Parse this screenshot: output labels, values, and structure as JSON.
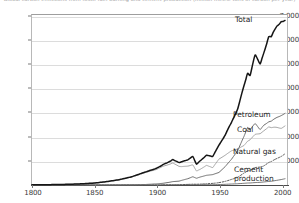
{
  "chart_title": "Global carbon emissions from fossil-fuel burning and cement production (million metric tons of carbon per year)",
  "axis": {
    "y_ticks": [
      "1,000",
      "2,000",
      "3,000",
      "4,000",
      "5,000",
      "6,000",
      "7,000"
    ],
    "x_ticks": [
      "1800",
      "1850",
      "1900",
      "1950",
      "2000"
    ]
  },
  "labels": {
    "total": "Total",
    "petroleum": "Petroleum",
    "coal": "Coal",
    "natural_gas": "Natural gas",
    "cement_line1": "Cement",
    "cement_line2": "production"
  },
  "colors": {
    "total": "#161616",
    "petroleum": "#6e6e6e",
    "coal": "#a0a0a0",
    "natural_gas": "#5a5a5a",
    "cement": "#555555",
    "grid": "#dcdcdc",
    "frame": "#b8b8b8",
    "text": "#1d1d1d"
  },
  "chart_data": {
    "type": "line",
    "title": "Global carbon emissions from fossil-fuel burning and cement production (million metric tons of carbon per year)",
    "xlabel": "",
    "ylabel": "",
    "xlim": [
      1800,
      2005
    ],
    "ylim": [
      0,
      7400
    ],
    "grid": true,
    "legend": "inline-right-of-line-ends",
    "x": [
      1800,
      1810,
      1820,
      1830,
      1840,
      1850,
      1860,
      1870,
      1880,
      1890,
      1900,
      1905,
      1910,
      1913,
      1918,
      1920,
      1925,
      1929,
      1932,
      1935,
      1940,
      1945,
      1950,
      1955,
      1960,
      1965,
      1970,
      1973,
      1975,
      1979,
      1983,
      1986,
      1990,
      1992,
      1995,
      2000,
      2003
    ],
    "series": [
      {
        "name": "Total",
        "style": "solid-thick",
        "color": "#161616",
        "values": [
          8,
          12,
          18,
          30,
          50,
          80,
          140,
          220,
          340,
          520,
          690,
          840,
          960,
          1050,
          930,
          960,
          1040,
          1180,
          860,
          1000,
          1230,
          1180,
          1650,
          2060,
          2580,
          3140,
          4090,
          4620,
          4530,
          5370,
          5000,
          5460,
          6130,
          6130,
          6440,
          6750,
          6800
        ]
      },
      {
        "name": "Petroleum",
        "style": "solid",
        "color": "#6e6e6e",
        "values": [
          0,
          0,
          0,
          0,
          0,
          0,
          1,
          3,
          8,
          18,
          46,
          70,
          110,
          140,
          160,
          190,
          260,
          340,
          280,
          330,
          400,
          430,
          520,
          760,
          1060,
          1420,
          2000,
          2380,
          2290,
          2540,
          2290,
          2470,
          2610,
          2640,
          2750,
          2870,
          2960
        ]
      },
      {
        "name": "Coal",
        "style": "solid",
        "color": "#a0a0a0",
        "values": [
          8,
          12,
          18,
          30,
          50,
          80,
          139,
          217,
          332,
          502,
          644,
          770,
          850,
          910,
          770,
          760,
          780,
          830,
          580,
          650,
          810,
          720,
          1070,
          1230,
          1410,
          1490,
          1630,
          1810,
          1870,
          2090,
          2120,
          2240,
          2400,
          2370,
          2390,
          2340,
          2440
        ]
      },
      {
        "name": "Natural gas",
        "style": "dotted",
        "color": "#5a5a5a",
        "values": [
          0,
          0,
          0,
          0,
          0,
          0,
          0,
          0,
          0,
          0,
          3,
          5,
          8,
          10,
          13,
          16,
          25,
          34,
          30,
          38,
          52,
          67,
          97,
          150,
          230,
          320,
          490,
          580,
          610,
          720,
          740,
          790,
          930,
          970,
          1060,
          1180,
          1290
        ]
      },
      {
        "name": "Cement production",
        "style": "solid-thin",
        "color": "#555555",
        "values": [
          0,
          0,
          0,
          0,
          0,
          0,
          0,
          0,
          0,
          0,
          1,
          2,
          3,
          5,
          4,
          6,
          9,
          12,
          8,
          11,
          16,
          12,
          18,
          28,
          40,
          52,
          70,
          82,
          84,
          100,
          110,
          125,
          148,
          155,
          180,
          225,
          260
        ]
      }
    ]
  }
}
